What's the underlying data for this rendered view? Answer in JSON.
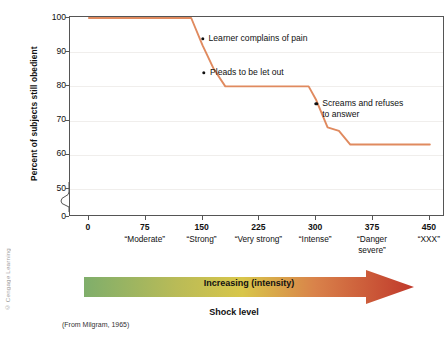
{
  "figure": {
    "copyright": "© Cengage Learning",
    "source_note": "(From Milgram, 1965)",
    "band_label": "Increasing (intensity)",
    "band_caption": "Shock level"
  },
  "colors": {
    "line": "#e08a5f",
    "axis": "#555555",
    "grid": "#f0eeec",
    "text": "#111111",
    "arrow_start": "#7fae6b",
    "arrow_mid": "#d8c64a",
    "arrow_end": "#c0392b"
  },
  "chart_data": {
    "type": "line",
    "title": "",
    "xlabel": "Shock level",
    "ylabel": "Percent of subjects still obedient",
    "xlim": [
      -25,
      470
    ],
    "ylim": [
      45,
      100
    ],
    "grid": true,
    "legend": "none",
    "y_axis_break": true,
    "y_ticks": [
      0,
      50,
      60,
      70,
      80,
      90,
      100
    ],
    "y_tick_labels": [
      "0",
      "50",
      "60",
      "70",
      "80",
      "90",
      "100"
    ],
    "x_ticks": [
      0,
      75,
      150,
      225,
      300,
      375,
      450
    ],
    "x_tick_labels": [
      "0",
      "75",
      "150",
      "225",
      "300",
      "375",
      "450"
    ],
    "x_category_labels": [
      {
        "at": 75,
        "text": "“Moderate”"
      },
      {
        "at": 150,
        "text": "“Strong”"
      },
      {
        "at": 225,
        "text": "“Very strong”"
      },
      {
        "at": 300,
        "text": "“Intense”"
      },
      {
        "at": 375,
        "text": "“Danger\nsevere”"
      },
      {
        "at": 450,
        "text": "“XXX”"
      }
    ],
    "series": [
      {
        "name": "Percent still obedient",
        "x": [
          0,
          15,
          135,
          150,
          165,
          180,
          290,
          300,
          315,
          330,
          345,
          450
        ],
        "values": [
          100,
          100,
          100,
          92,
          85,
          80,
          80,
          76,
          68,
          67,
          63,
          63
        ]
      }
    ],
    "annotations": [
      {
        "text": "Learner complains of pain",
        "x": 150,
        "y": 94
      },
      {
        "text": "Pleads to be let out",
        "x": 152,
        "y": 84
      },
      {
        "text": "Screams and refuses\nto answer",
        "x": 300,
        "y": 75
      }
    ]
  }
}
